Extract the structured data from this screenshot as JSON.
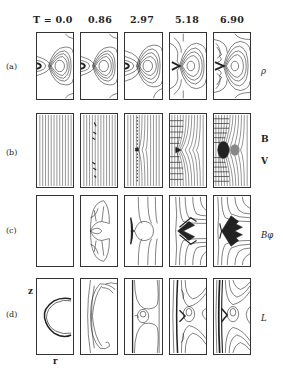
{
  "figure": {
    "time_header_prefix": "T = ",
    "times": [
      "0.0",
      "0.86",
      "2.97",
      "5.18",
      "6.90"
    ],
    "time_labels": [
      "T = 0.0",
      "0.86",
      "2.97",
      "5.18",
      "6.90"
    ],
    "rows": [
      {
        "id": "a",
        "label": "(a)",
        "variables": [
          "ρ"
        ],
        "description": "density contours"
      },
      {
        "id": "b",
        "label": "(b)",
        "variables": [
          "B",
          "V"
        ],
        "description": "field lines and velocity vectors"
      },
      {
        "id": "c",
        "label": "(c)",
        "variables": [
          "Bφ"
        ],
        "description": "toroidal field contours"
      },
      {
        "id": "d",
        "label": "(d)",
        "variables": [
          "L"
        ],
        "description": "contours"
      }
    ],
    "axes": {
      "vertical": "z",
      "horizontal": "r"
    },
    "colors": {
      "line": "#222222",
      "background": "#ffffff"
    }
  }
}
